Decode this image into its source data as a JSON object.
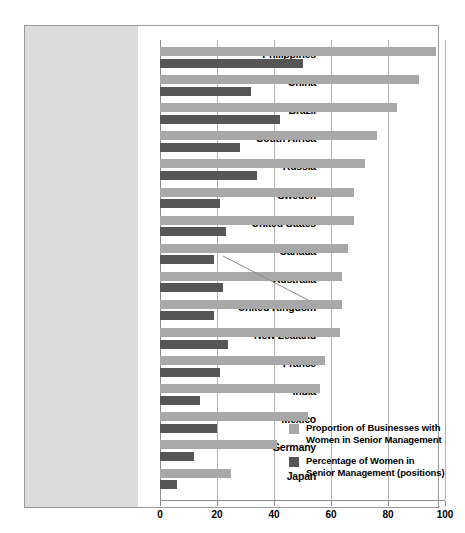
{
  "chart_data": {
    "type": "bar",
    "orientation": "horizontal",
    "title": "",
    "xlabel": "",
    "ylabel": "",
    "xlim": [
      0,
      100
    ],
    "xticks": [
      0,
      20,
      40,
      60,
      80,
      100
    ],
    "xtick_labels": [
      "0",
      "20",
      "40",
      "60",
      "80",
      "100"
    ],
    "grid": true,
    "legend_position": "inside-bottom-right",
    "categories": [
      "Philippines",
      "China",
      "Brazil",
      "South Africa",
      "Russia",
      "Sweden",
      "United States",
      "Canada",
      "Australia",
      "United Kingdom",
      "New Zealand",
      "France",
      "India",
      "Mexico",
      "Germany",
      "Japan"
    ],
    "series": [
      {
        "name": "Proportion of Businesses with Women in Senior Management",
        "color": "#a8a8a8",
        "values": [
          97,
          91,
          83,
          76,
          72,
          68,
          68,
          66,
          64,
          64,
          63,
          58,
          56,
          52,
          41,
          25
        ]
      },
      {
        "name": "Percentage of Women in Senior Management (positions)",
        "color": "#565656",
        "values": [
          50,
          32,
          42,
          28,
          34,
          21,
          23,
          19,
          22,
          19,
          24,
          21,
          14,
          20,
          12,
          6
        ]
      }
    ]
  },
  "legend": {
    "items": [
      {
        "swatch_color": "#a8a8a8",
        "line1": "Proportion of Businesses with",
        "line2": "Women in Senior Management"
      },
      {
        "swatch_color": "#565656",
        "line1": "Percentage of Women in",
        "line2": "Senior Management (positions)"
      }
    ]
  }
}
